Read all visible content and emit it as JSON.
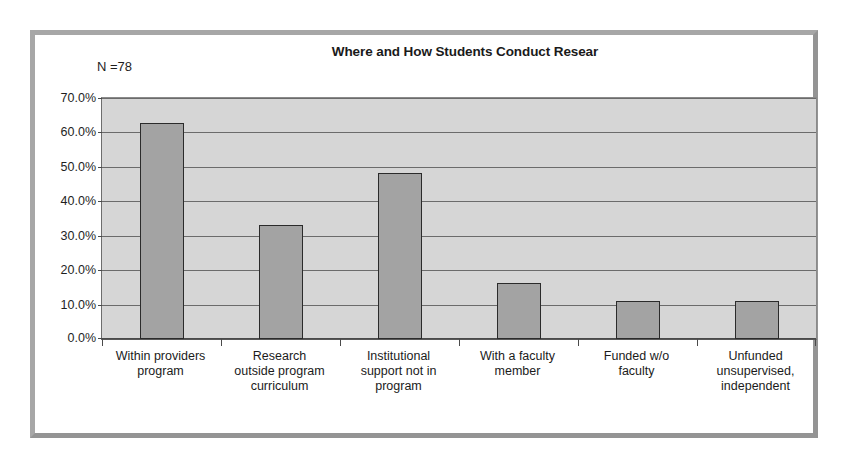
{
  "figure": {
    "title": "Where and How Students Conduct Resear",
    "sample_size_label": "N =78",
    "frame_color": "#9d9d9d",
    "plot_background": "#d6d6d6",
    "bar_fill": "#a3a3a3",
    "bar_outline": "#2b2b2b",
    "gridline_color": "#6b6b6b"
  },
  "chart_data": {
    "type": "bar",
    "title": "Where and How Students Conduct Resear",
    "xlabel": "",
    "ylabel": "",
    "ylim": [
      0,
      70
    ],
    "yticks": [
      0,
      10,
      20,
      30,
      40,
      50,
      60,
      70
    ],
    "ytick_labels": [
      "0.0%",
      "10.0%",
      "20.0%",
      "30.0%",
      "40.0%",
      "50.0%",
      "60.0%",
      "70.0%"
    ],
    "grid": true,
    "legend": false,
    "annotations": [
      "N =78"
    ],
    "categories": [
      "Within providers\nprogram",
      "Research\noutside program\ncurriculum",
      "Institutional\nsupport not in\nprogram",
      "With a faculty\nmember",
      "Funded w/o\nfaculty",
      "Unfunded\nunsupervised,\nindependent"
    ],
    "values": [
      62.6,
      33.1,
      48.1,
      16.2,
      10.9,
      10.9
    ]
  }
}
